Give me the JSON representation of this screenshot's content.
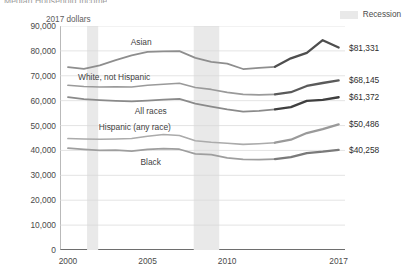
{
  "chart_title": "Median Household Income",
  "unit_note": "2017 dollars",
  "legend": {
    "recession_label": "Recession",
    "recession_color": "#e9e9e9"
  },
  "axes": {
    "y_ticks": [
      "0",
      "10,000",
      "20,000",
      "30,000",
      "40,000",
      "50,000",
      "60,000",
      "70,000",
      "80,000",
      "90,000"
    ],
    "y_tick_values": [
      0,
      10000,
      20000,
      30000,
      40000,
      50000,
      60000,
      70000,
      80000,
      90000
    ],
    "x_ticks": [
      "2000",
      "2005",
      "2010",
      "2017"
    ],
    "x_tick_values": [
      2000,
      2005,
      2010,
      2017
    ]
  },
  "series_labels": {
    "asian": "Asian",
    "white": "White, not Hispanic",
    "all": "All races",
    "hispanic": "Hispanic (any race)",
    "black": "Black"
  },
  "end_values": {
    "asian": "$81,331",
    "white": "$68,145",
    "all": "$61,372",
    "hispanic": "$50,486",
    "black": "$40,258"
  },
  "chart_data": {
    "type": "line",
    "title": "Median Household Income",
    "subtitle": "2017 dollars",
    "xlabel": "",
    "ylabel": "",
    "xlim": [
      1999.5,
      2017.4
    ],
    "ylim": [
      0,
      90000
    ],
    "grid": "horizontal",
    "legend_position": "top-right",
    "x": [
      2000,
      2001,
      2002,
      2003,
      2004,
      2005,
      2006,
      2007,
      2008,
      2009,
      2010,
      2011,
      2012,
      2013,
      2014,
      2015,
      2016,
      2017
    ],
    "series": [
      {
        "name": "Asian",
        "color": "#8e8e8e",
        "color_recent": "#4e4e4e",
        "break_year": 2013,
        "end_label": "$81,331",
        "values": [
          73500,
          72800,
          74200,
          76300,
          78200,
          79600,
          79800,
          79900,
          77200,
          75600,
          74900,
          72700,
          73200,
          73600,
          77000,
          79200,
          84300,
          81331
        ]
      },
      {
        "name": "White, not Hispanic",
        "color": "#9a9a9a",
        "color_recent": "#5a5a5a",
        "break_year": 2013,
        "end_label": "$68,145",
        "values": [
          66200,
          65700,
          65500,
          65600,
          65500,
          66200,
          66600,
          67000,
          65300,
          64500,
          63300,
          62500,
          62300,
          62500,
          63400,
          65900,
          67100,
          68145
        ]
      },
      {
        "name": "All races",
        "color": "#8a8a8a",
        "color_recent": "#3f3f3f",
        "break_year": 2013,
        "end_label": "$61,372",
        "values": [
          61400,
          60600,
          60200,
          59900,
          59700,
          60000,
          60400,
          60700,
          58800,
          57600,
          56500,
          55600,
          55900,
          56500,
          57400,
          59900,
          60300,
          61372
        ]
      },
      {
        "name": "Hispanic (any race)",
        "color": "#ababab",
        "color_recent": "#9a9a9a",
        "break_year": 2013,
        "end_label": "$50,486",
        "values": [
          44800,
          44600,
          44500,
          44600,
          44800,
          45700,
          46400,
          46000,
          43900,
          43300,
          42900,
          42400,
          42700,
          43100,
          44300,
          47000,
          48600,
          50486
        ]
      },
      {
        "name": "Black",
        "color": "#9e9e9e",
        "color_recent": "#7a7a7a",
        "break_year": 2013,
        "end_label": "$40,258",
        "values": [
          40900,
          40400,
          40000,
          40100,
          39700,
          40400,
          40700,
          40500,
          38600,
          38300,
          37000,
          36400,
          36300,
          36500,
          37300,
          38900,
          39500,
          40258
        ]
      }
    ],
    "shaded_regions": [
      {
        "label": "Recession",
        "x0": 2001.2,
        "x1": 2001.9,
        "color": "#e9e9e9"
      },
      {
        "label": "Recession",
        "x0": 2007.9,
        "x1": 2009.5,
        "color": "#e9e9e9"
      }
    ]
  }
}
